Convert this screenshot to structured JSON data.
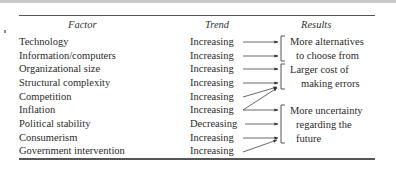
{
  "table": {
    "headers": {
      "factor": "Factor",
      "trend": "Trend",
      "results": "Results"
    },
    "rows": [
      {
        "factor": "Technology",
        "trend": "Increasing",
        "result_group": 0
      },
      {
        "factor": "Information/computers",
        "trend": "Increasing",
        "result_group": 0
      },
      {
        "factor": "Organizational size",
        "trend": "Increasing",
        "result_group": 1
      },
      {
        "factor": "Structural complexity",
        "trend": "Increasing",
        "result_group": 1
      },
      {
        "factor": "Competition",
        "trend": "Increasing",
        "result_group": 1
      },
      {
        "factor": "Inflation",
        "trend": "Increasing",
        "result_group": [
          1,
          2
        ]
      },
      {
        "factor": "Political stability",
        "trend": "Decreasing",
        "result_group": 2
      },
      {
        "factor": "Consumerism",
        "trend": "Increasing",
        "result_group": 2
      },
      {
        "factor": "Government intervention",
        "trend": "Increasing",
        "result_group": 2
      }
    ],
    "results": [
      {
        "line1": "More alternatives",
        "line2": "to choose from"
      },
      {
        "line1": "Larger cost of",
        "line2": "making errors"
      },
      {
        "line1": "More uncertainty",
        "line2": "regarding the",
        "line3": "future"
      }
    ]
  }
}
